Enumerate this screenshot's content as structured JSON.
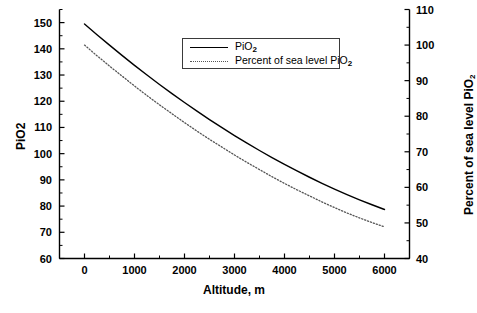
{
  "chart_data": {
    "type": "line",
    "title": "",
    "xlabel": "Altitude, m",
    "ylabel": "PiO2",
    "ylabel_right": "Percent of sea level PiO2",
    "xlim": [
      -500,
      6500
    ],
    "ylim": [
      60,
      155
    ],
    "ylim_right": [
      40,
      110
    ],
    "grid": false,
    "legend_position": "upper-center",
    "x_ticks": [
      0,
      1000,
      2000,
      3000,
      4000,
      5000,
      6000
    ],
    "x_tick_labels": [
      "0",
      "1000",
      "2000",
      "3000",
      "4000",
      "5000",
      "6000"
    ],
    "x_minor_tick_interval": 500,
    "y_ticks": [
      60,
      70,
      80,
      90,
      100,
      110,
      120,
      130,
      140,
      150
    ],
    "y_tick_labels": [
      "60",
      "70",
      "80",
      "90",
      "100",
      "110",
      "120",
      "130",
      "140",
      "150"
    ],
    "y_minor_tick_interval": 5,
    "y_right_ticks": [
      40,
      50,
      60,
      70,
      80,
      90,
      100,
      110
    ],
    "y_right_tick_labels": [
      "40",
      "50",
      "60",
      "70",
      "80",
      "90",
      "100",
      "110"
    ],
    "y_right_minor_tick_interval": 5,
    "x": [
      0,
      250,
      500,
      750,
      1000,
      1250,
      1500,
      1750,
      2000,
      2250,
      2500,
      2750,
      3000,
      3250,
      3500,
      3750,
      4000,
      4250,
      4500,
      4750,
      5000,
      5250,
      5500,
      5750,
      6000
    ],
    "series": [
      {
        "name": "PiO2",
        "style": "solid",
        "color": "#000000",
        "axis": "left",
        "values": [
          149.5,
          145.4,
          141.4,
          137.5,
          133.7,
          130.0,
          126.4,
          122.9,
          119.5,
          116.2,
          113.0,
          109.9,
          106.9,
          104.0,
          101.2,
          98.5,
          95.9,
          93.4,
          91.0,
          88.7,
          86.5,
          84.4,
          82.4,
          80.5,
          78.7
        ]
      },
      {
        "name": "Percent of sea level PiO2",
        "style": "dotted",
        "color": "#555555",
        "axis": "right",
        "values": [
          100.0,
          97.0,
          94.1,
          91.3,
          88.5,
          85.8,
          83.2,
          80.7,
          78.2,
          75.8,
          73.5,
          71.3,
          69.1,
          67.0,
          65.0,
          63.0,
          61.1,
          59.3,
          57.6,
          55.9,
          54.3,
          52.8,
          51.4,
          50.1,
          48.9
        ]
      }
    ],
    "legend": [
      {
        "label": "PiO",
        "sub": "2",
        "style": "solid"
      },
      {
        "label": "Percent of sea level PiO",
        "sub": "2",
        "style": "dotted"
      }
    ]
  },
  "axes": {
    "x_title": "Altitude, m",
    "y_left_title": "PiO2",
    "y_right_title_main": "Percent of sea level PiO",
    "y_right_title_sub": "2"
  }
}
